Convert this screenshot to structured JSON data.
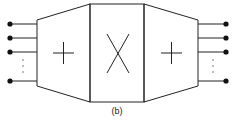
{
  "figure": {
    "caption": "(b)",
    "blocks": [
      {
        "id": "left-adder",
        "symbol": "+"
      },
      {
        "id": "center-multiplier",
        "symbol": "×"
      },
      {
        "id": "right-adder",
        "symbol": "+"
      }
    ],
    "inputs": {
      "count_visible": 4,
      "ellipsis": "⋮"
    },
    "outputs": {
      "count_visible": 4,
      "ellipsis": "⋮"
    },
    "colors": {
      "stroke": "#222222",
      "background": "#ffffff"
    }
  }
}
